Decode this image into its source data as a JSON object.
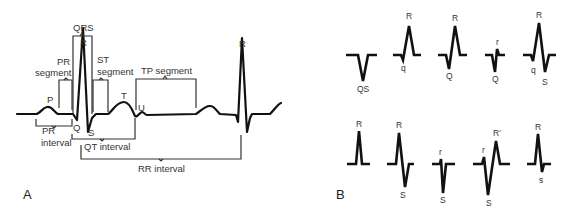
{
  "panel_a": {
    "label": "A",
    "waves": {
      "p": "P",
      "q": "Q",
      "r": "R",
      "s": "S",
      "t": "T",
      "u": "U",
      "r2": "R"
    },
    "brackets": {
      "qrs": "QRS",
      "pr_segment_1": "PR",
      "pr_segment_2": "segment",
      "st_segment_1": "ST",
      "st_segment_2": "segment",
      "tp_segment": "TP segment",
      "pr_interval_1": "PR",
      "pr_interval_2": "interval",
      "qt_interval": "QT interval",
      "rr_interval": "RR interval"
    }
  },
  "panel_b": {
    "label": "B",
    "row1": [
      {
        "labels": [
          "QS"
        ]
      },
      {
        "labels": [
          "R",
          "q"
        ]
      },
      {
        "labels": [
          "R",
          "Q"
        ]
      },
      {
        "labels": [
          "r",
          "Q"
        ]
      },
      {
        "labels": [
          "R",
          "q",
          "S"
        ]
      }
    ],
    "row2": [
      {
        "labels": [
          "R"
        ]
      },
      {
        "labels": [
          "R",
          "S"
        ]
      },
      {
        "labels": [
          "r",
          "S"
        ]
      },
      {
        "labels": [
          "r",
          "R′",
          "S"
        ]
      },
      {
        "labels": [
          "R",
          "s"
        ]
      }
    ]
  }
}
